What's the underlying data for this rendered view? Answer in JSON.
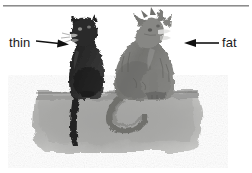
{
  "figure": {
    "title": "",
    "background_color": "#ffffff",
    "rule": {
      "name": "top-horizontal-rule",
      "color": "#8c8c8c"
    },
    "annotations": [
      {
        "label": "thin",
        "arrow_direction": "right",
        "target": "left-dark-cat",
        "color": "#1a1a1a"
      },
      {
        "label": "fat",
        "arrow_direction": "left",
        "target": "right-gray-cat",
        "color": "#1a1a1a"
      }
    ],
    "subjects": [
      {
        "name": "thin-cat",
        "position": "left",
        "tone": "dark",
        "color": "#2b2b2b"
      },
      {
        "name": "fat-cat",
        "position": "right",
        "tone": "mid-gray",
        "color": "#7a7a78"
      }
    ],
    "ground": {
      "name": "ground-wash",
      "color": "#a9a9a7"
    }
  }
}
